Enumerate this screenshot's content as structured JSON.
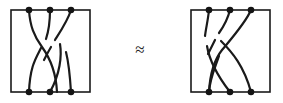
{
  "figure": {
    "width": 283,
    "height": 103,
    "background_color": "#ffffff",
    "ink_color": "#1a1a1a",
    "node_color": "#141414"
  },
  "relation": {
    "symbol": "≈",
    "name": "approximately-equal",
    "meaning": "is equivalent to",
    "x": 140,
    "y": 51
  },
  "diagrams": [
    {
      "id": "left-tangle",
      "label": "left tangle diagram",
      "frame": {
        "x": 11,
        "y": 10,
        "width": 79,
        "height": 82
      },
      "top_nodes": [
        {
          "id": "t1",
          "x": 29,
          "y": 10
        },
        {
          "id": "t2",
          "x": 50,
          "y": 10
        },
        {
          "id": "t3",
          "x": 71,
          "y": 10
        }
      ],
      "bottom_nodes": [
        {
          "id": "b1",
          "x": 29,
          "y": 92
        },
        {
          "id": "b2",
          "x": 50,
          "y": 92
        },
        {
          "id": "b3",
          "x": 71,
          "y": 92
        }
      ],
      "strands": [
        {
          "id": "L-strand-A",
          "from": "t1",
          "to": "b2",
          "path": "M 29 10 C 30 26 34 36 42 47 C 50 58 56 72 57 92"
        },
        {
          "id": "L-strand-B-upper",
          "from": "t2",
          "to": "break",
          "path": "M 50 10 C 50 22 49 30 46 39"
        },
        {
          "id": "L-strand-B-lower",
          "from": "break",
          "to": "b1",
          "path": "M 41 48 C 36 58 30 66 29 92"
        },
        {
          "id": "L-strand-C-upper",
          "from": "t3",
          "to": "break",
          "path": "M 71 10 C 68 20 62 29 55 40"
        },
        {
          "id": "L-strand-C-mid",
          "from": "break",
          "to": "break",
          "path": "M 51 47 C 48 52 46 56 44 60"
        },
        {
          "id": "L-strand-C-lower",
          "from": "break",
          "to": "b3",
          "path": "M 66 52 C 69 64 70 76 71 92"
        },
        {
          "id": "L-strand-D",
          "from": "crossing",
          "to": "b2",
          "path": "M 60 44 C 62 56 60 74 50 92"
        }
      ],
      "crossings": 3
    },
    {
      "id": "right-tangle",
      "label": "right tangle diagram",
      "frame": {
        "x": 191,
        "y": 10,
        "width": 79,
        "height": 82
      },
      "top_nodes": [
        {
          "id": "t1",
          "x": 209,
          "y": 10
        },
        {
          "id": "t2",
          "x": 230,
          "y": 10
        },
        {
          "id": "t3",
          "x": 251,
          "y": 10
        }
      ],
      "bottom_nodes": [
        {
          "id": "b1",
          "x": 209,
          "y": 92
        },
        {
          "id": "b2",
          "x": 230,
          "y": 92
        },
        {
          "id": "b3",
          "x": 251,
          "y": 92
        }
      ],
      "strands": [
        {
          "id": "R-strand-A-upper",
          "from": "t1",
          "to": "break",
          "path": "M 209 10 C 208 20 206 28 205 36"
        },
        {
          "id": "R-strand-A-lower",
          "from": "break",
          "to": "b2",
          "path": "M 207 46 C 209 58 216 74 230 92"
        },
        {
          "id": "R-strand-B-upper",
          "from": "t2",
          "to": "break",
          "path": "M 230 10 C 228 18 224 26 219 33"
        },
        {
          "id": "R-strand-B-mid",
          "from": "break",
          "to": "break",
          "path": "M 215 40 C 212 46 210 50 208 54"
        },
        {
          "id": "R-strand-B-lower",
          "from": "break",
          "to": "b1",
          "path": "M 219 56 C 215 68 210 78 209 92"
        },
        {
          "id": "R-strand-C",
          "from": "t3",
          "to": "b1",
          "path": "M 251 10 C 246 22 232 38 222 50 C 214 60 210 74 209 92"
        },
        {
          "id": "R-strand-D",
          "from": "crossing",
          "to": "b3",
          "path": "M 221 41 C 232 52 244 66 251 92"
        }
      ],
      "crossings": 3
    }
  ]
}
